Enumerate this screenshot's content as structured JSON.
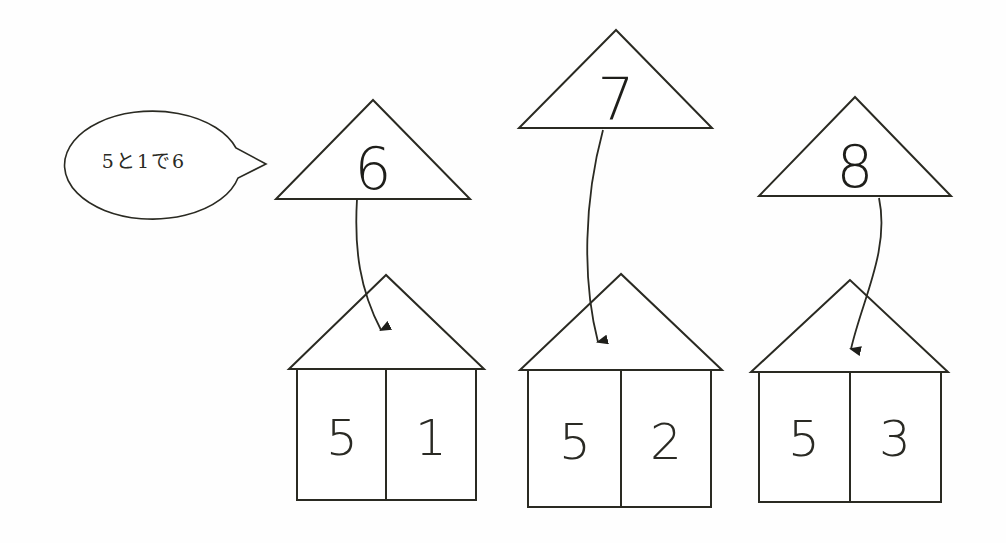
{
  "speech_bubble": {
    "text": "5と1で6"
  },
  "triangles": [
    {
      "number": "6"
    },
    {
      "number": "7"
    },
    {
      "number": "8"
    }
  ],
  "houses": [
    {
      "left": "5",
      "right": "1"
    },
    {
      "left": "5",
      "right": "2"
    },
    {
      "left": "5",
      "right": "3"
    }
  ],
  "colors": {
    "line": "#2a2a22",
    "background": "#fefefe"
  }
}
